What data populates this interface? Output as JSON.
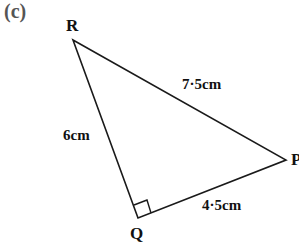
{
  "part_label": "(c)",
  "vertices": {
    "R": "R",
    "P": "P",
    "Q": "Q"
  },
  "sides": {
    "RP": "7·5cm",
    "RQ": "6cm",
    "QP": "4·5cm"
  },
  "right_angle_at": "Q",
  "colors": {
    "line": "#1a1a1a",
    "text": "#111111",
    "part_label": "#555555"
  }
}
